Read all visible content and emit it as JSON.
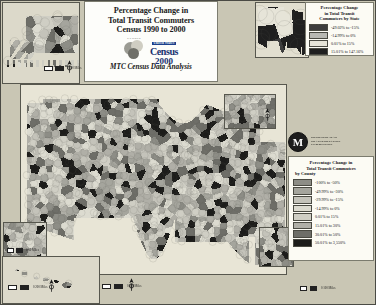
{
  "poster": {
    "background_color": "#c9c6b4",
    "title_lines": [
      "Percentage Change in",
      "Total Transit Commuters",
      "Census 1990 to 2000"
    ],
    "subtitle": "MTC Census Data Analysis"
  },
  "census_logo": {
    "globe_caption": "C E N S U S",
    "wordmark_small": "United States",
    "wordmark_main": "Census",
    "wordmark_year": "2000"
  },
  "mtc_logo": {
    "monogram": "M",
    "line1": "METROPOLITAN",
    "line2": "TRANSPORTATION",
    "line3": "COMMISSION"
  },
  "state_legend": {
    "title_lines": [
      "Percentage Change",
      "in Total Transit",
      "Commuters by State"
    ],
    "entries": [
      {
        "label": "-49.02% to -15%",
        "color": "#3d3d3d"
      },
      {
        "label": "-14.99% to 0%",
        "color": "#b9b9b3"
      },
      {
        "label": "0.01% to 15%",
        "color": "#e6e4d8"
      },
      {
        "label": "15.01% to 147.16%",
        "color": "#1f1f1f"
      }
    ]
  },
  "county_legend": {
    "title_lines": [
      "Percentage Change in",
      "Total Transit Commuters",
      "by County"
    ],
    "entries": [
      {
        "label": "-100% to -50%",
        "color": "#8d8d86"
      },
      {
        "label": "-49.99% to -30%",
        "color": "#a5a59d"
      },
      {
        "label": "-29.99% to -15%",
        "color": "#c4c3ba"
      },
      {
        "label": "-14.99% to 0%",
        "color": "#dcdbd0"
      },
      {
        "label": "0.01% to 15%",
        "color": "#cfcec4"
      },
      {
        "label": "15.01% to 30%",
        "color": "#b0afa7"
      },
      {
        "label": "30.01% to 50%",
        "color": "#6e6e68"
      },
      {
        "label": "50.01% to 3,550%",
        "color": "#1c1c1a"
      }
    ]
  },
  "scales": {
    "main": "0            500 Miles",
    "hawaii": "0      200 Miles",
    "alaska": "0   500 Miles",
    "inset_left": "0      50 Miles",
    "inset_right": "0   100 Miles"
  },
  "insets": {
    "alaska": "Alaska",
    "hawaii": "Hawaii",
    "northeast": "Northeast Detail",
    "puerto_rico": "Puerto Rico",
    "left_detail": "Bay Area Detail",
    "states": "States Overview"
  },
  "chart_data": {
    "type": "heatmap",
    "subtitle": "MTC Census Data Analysis",
    "legend_position": "right",
    "grid": false,
    "xlabel": "",
    "ylabel": "",
    "series": [
      {
        "name": "Percentage Change in Total Transit Commuters by County",
        "categories": [
          "-100% to -50%",
          "-49.99% to -30%",
          "-29.99% to -15%",
          "-14.99% to 0%",
          "0.01% to 15%",
          "15.01% to 30%",
          "30.01% to 50%",
          "50.01% to 3,550%"
        ],
        "colors": [
          "#8d8d86",
          "#a5a59d",
          "#c4c3ba",
          "#dcdbd0",
          "#cfcec4",
          "#b0afa7",
          "#6e6e68",
          "#1c1c1a"
        ],
        "bins": [
          [
            -100,
            -50
          ],
          [
            -49.99,
            -30
          ],
          [
            -29.99,
            -15
          ],
          [
            -14.99,
            0
          ],
          [
            0.01,
            15
          ],
          [
            15.01,
            30
          ],
          [
            30.01,
            50
          ],
          [
            50.01,
            3550
          ]
        ]
      },
      {
        "name": "Percentage Change in Total Transit Commuters by State",
        "categories": [
          "-49.02% to -15%",
          "-14.99% to 0%",
          "0.01% to 15%",
          "15.01% to 147.16%"
        ],
        "colors": [
          "#3d3d3d",
          "#b9b9b3",
          "#e6e4d8",
          "#1f1f1f"
        ],
        "bins": [
          [
            -49.02,
            -15
          ],
          [
            -14.99,
            0
          ],
          [
            0.01,
            15
          ],
          [
            15.01,
            147.16
          ]
        ]
      }
    ]
  }
}
